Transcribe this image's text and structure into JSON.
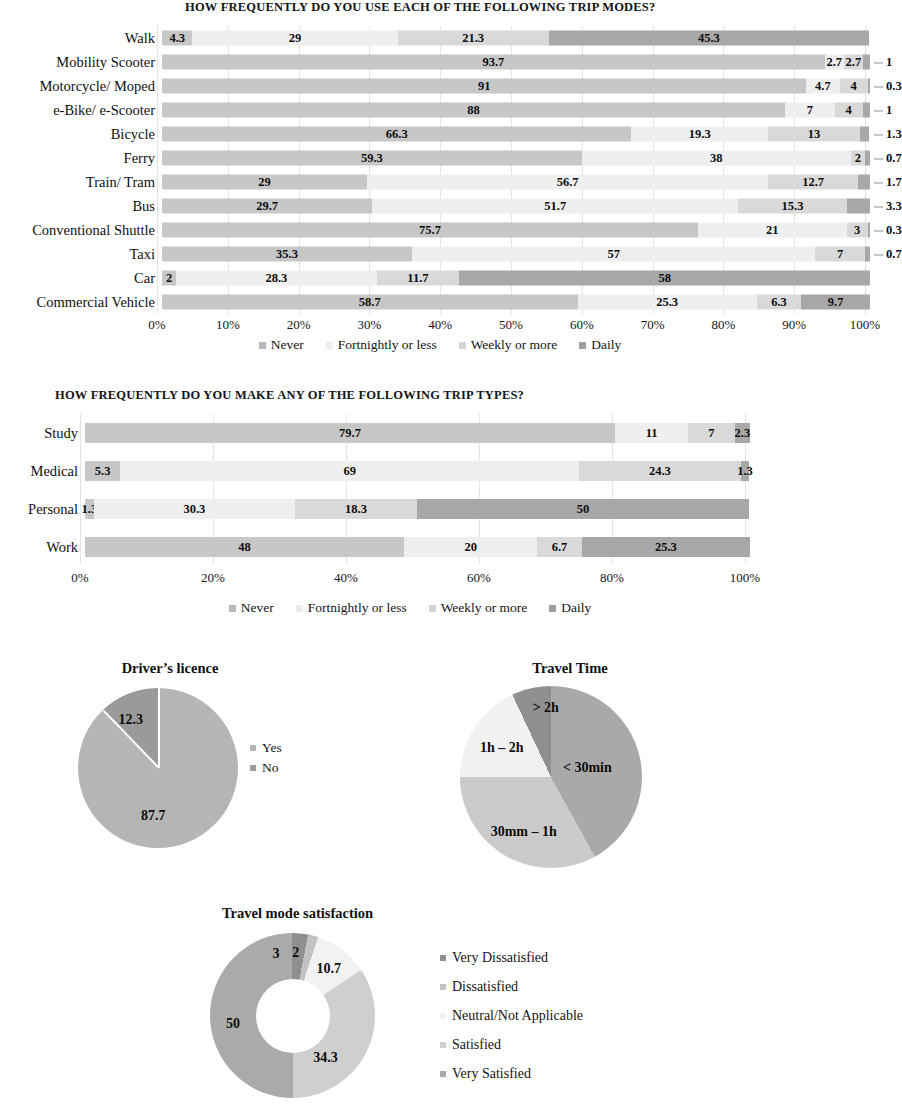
{
  "chart_data": [
    {
      "type": "bar",
      "id": "trip-modes",
      "orientation": "horizontal",
      "stacked": true,
      "percent": true,
      "title": "HOW FREQUENTLY DO YOU USE EACH OF THE FOLLOWING TRIP MODES?",
      "xlabel": "",
      "ylabel": "",
      "xlim": [
        0,
        100
      ],
      "grid": true,
      "legend_position": "bottom",
      "tick_labels": [
        "0%",
        "10%",
        "20%",
        "30%",
        "40%",
        "50%",
        "60%",
        "70%",
        "80%",
        "90%",
        "100%"
      ],
      "legend": [
        "Never",
        "Fortnightly or less",
        "Weekly or more",
        "Daily"
      ],
      "colors": [
        "#c7c7c7",
        "#efefef",
        "#d9d9d9",
        "#a8a8a8"
      ],
      "categories": [
        "Walk",
        "Mobility Scooter",
        "Motorcycle/ Moped",
        "e-Bike/ e-Scooter",
        "Bicycle",
        "Ferry",
        "Train/ Tram",
        "Bus",
        "Conventional Shuttle",
        "Taxi",
        "Car",
        "Commercial Vehicle"
      ],
      "series": [
        {
          "name": "Never",
          "values": [
            4.3,
            93.7,
            91,
            88,
            66.3,
            59.3,
            29,
            29.7,
            75.7,
            35.3,
            2,
            58.7
          ]
        },
        {
          "name": "Fortnightly or less",
          "values": [
            29,
            2.7,
            4.7,
            7,
            19.3,
            38,
            56.7,
            51.7,
            21,
            57,
            28.3,
            25.3
          ]
        },
        {
          "name": "Weekly or more",
          "values": [
            21.3,
            2.7,
            4,
            4,
            13,
            2,
            12.7,
            15.3,
            3,
            7,
            11.7,
            6.3
          ]
        },
        {
          "name": "Daily",
          "values": [
            45.3,
            1,
            0.3,
            1,
            1.3,
            0.7,
            1.7,
            3.3,
            0.3,
            0.7,
            58,
            9.7
          ]
        }
      ],
      "rows": [
        {
          "label": "Walk",
          "segments": [
            {
              "v": "4.3",
              "n": 4.3
            },
            {
              "v": "29",
              "n": 29
            },
            {
              "v": "21.3",
              "n": 21.3
            },
            {
              "v": "45.3",
              "n": 45.3
            }
          ],
          "outside": null
        },
        {
          "label": "Mobility Scooter",
          "segments": [
            {
              "v": "93.7",
              "n": 93.7
            },
            {
              "v": "2.7",
              "n": 2.7
            },
            {
              "v": "2.7",
              "n": 2.7
            },
            {
              "v": "",
              "n": 1
            }
          ],
          "outside": "1"
        },
        {
          "label": "Motorcycle/ Moped",
          "segments": [
            {
              "v": "91",
              "n": 91
            },
            {
              "v": "4.7",
              "n": 4.7
            },
            {
              "v": "4",
              "n": 4
            },
            {
              "v": "",
              "n": 0.3
            }
          ],
          "outside": "0.3"
        },
        {
          "label": "e-Bike/ e-Scooter",
          "segments": [
            {
              "v": "88",
              "n": 88
            },
            {
              "v": "7",
              "n": 7
            },
            {
              "v": "4",
              "n": 4
            },
            {
              "v": "",
              "n": 1
            }
          ],
          "outside": "1"
        },
        {
          "label": "Bicycle",
          "segments": [
            {
              "v": "66.3",
              "n": 66.3
            },
            {
              "v": "19.3",
              "n": 19.3
            },
            {
              "v": "13",
              "n": 13
            },
            {
              "v": "",
              "n": 1.3
            }
          ],
          "outside": "1.3"
        },
        {
          "label": "Ferry",
          "segments": [
            {
              "v": "59.3",
              "n": 59.3
            },
            {
              "v": "38",
              "n": 38
            },
            {
              "v": "2",
              "n": 2
            },
            {
              "v": "",
              "n": 0.7
            }
          ],
          "outside": "0.7"
        },
        {
          "label": "Train/ Tram",
          "segments": [
            {
              "v": "29",
              "n": 29
            },
            {
              "v": "56.7",
              "n": 56.7
            },
            {
              "v": "12.7",
              "n": 12.7
            },
            {
              "v": "",
              "n": 1.7
            }
          ],
          "outside": "1.7"
        },
        {
          "label": "Bus",
          "segments": [
            {
              "v": "29.7",
              "n": 29.7
            },
            {
              "v": "51.7",
              "n": 51.7
            },
            {
              "v": "15.3",
              "n": 15.3
            },
            {
              "v": "",
              "n": 3.3
            }
          ],
          "outside": "3.3"
        },
        {
          "label": "Conventional Shuttle",
          "segments": [
            {
              "v": "75.7",
              "n": 75.7
            },
            {
              "v": "21",
              "n": 21
            },
            {
              "v": "3",
              "n": 3
            },
            {
              "v": "",
              "n": 0.3
            }
          ],
          "outside": "0.3"
        },
        {
          "label": "Taxi",
          "segments": [
            {
              "v": "35.3",
              "n": 35.3
            },
            {
              "v": "57",
              "n": 57
            },
            {
              "v": "7",
              "n": 7
            },
            {
              "v": "",
              "n": 0.7
            }
          ],
          "outside": "0.7"
        },
        {
          "label": "Car",
          "segments": [
            {
              "v": "2",
              "n": 2
            },
            {
              "v": "28.3",
              "n": 28.3
            },
            {
              "v": "11.7",
              "n": 11.7
            },
            {
              "v": "58",
              "n": 58
            }
          ],
          "outside": null
        },
        {
          "label": "Commercial Vehicle",
          "segments": [
            {
              "v": "58.7",
              "n": 58.7
            },
            {
              "v": "25.3",
              "n": 25.3
            },
            {
              "v": "6.3",
              "n": 6.3
            },
            {
              "v": "9.7",
              "n": 9.7
            }
          ],
          "outside": null
        }
      ]
    },
    {
      "type": "bar",
      "id": "trip-types",
      "orientation": "horizontal",
      "stacked": true,
      "percent": true,
      "title": "HOW FREQUENTLY DO YOU MAKE ANY OF THE FOLLOWING TRIP TYPES?",
      "xlabel": "",
      "ylabel": "",
      "xlim": [
        0,
        100
      ],
      "grid": true,
      "legend_position": "bottom",
      "tick_labels": [
        "0%",
        "20%",
        "40%",
        "60%",
        "80%",
        "100%"
      ],
      "legend": [
        "Never",
        "Fortnightly or less",
        "Weekly or more",
        "Daily"
      ],
      "colors": [
        "#c7c7c7",
        "#efefef",
        "#d9d9d9",
        "#a8a8a8"
      ],
      "categories": [
        "Study",
        "Medical",
        "Personal",
        "Work"
      ],
      "series": [
        {
          "name": "Never",
          "values": [
            79.7,
            5.3,
            1.3,
            48
          ]
        },
        {
          "name": "Fortnightly or less",
          "values": [
            11,
            69,
            30.3,
            20
          ]
        },
        {
          "name": "Weekly or more",
          "values": [
            7,
            24.3,
            18.3,
            6.7
          ]
        },
        {
          "name": "Daily",
          "values": [
            2.3,
            1.3,
            50,
            25.3
          ]
        }
      ],
      "rows": [
        {
          "label": "Study",
          "segments": [
            {
              "v": "79.7",
              "n": 79.7
            },
            {
              "v": "11",
              "n": 11
            },
            {
              "v": "7",
              "n": 7
            },
            {
              "v": "2.3",
              "n": 2.3
            }
          ],
          "outside": null
        },
        {
          "label": "Medical",
          "segments": [
            {
              "v": "5.3",
              "n": 5.3
            },
            {
              "v": "69",
              "n": 69
            },
            {
              "v": "24.3",
              "n": 24.3
            },
            {
              "v": "1.3",
              "n": 1.3
            }
          ],
          "outside": null
        },
        {
          "label": "Personal",
          "segments": [
            {
              "v": "1.3",
              "n": 1.3
            },
            {
              "v": "30.3",
              "n": 30.3
            },
            {
              "v": "18.3",
              "n": 18.3
            },
            {
              "v": "50",
              "n": 50
            }
          ],
          "outside": null
        },
        {
          "label": "Work",
          "segments": [
            {
              "v": "48",
              "n": 48
            },
            {
              "v": "20",
              "n": 20
            },
            {
              "v": "6.7",
              "n": 6.7
            },
            {
              "v": "25.3",
              "n": 25.3
            }
          ],
          "outside": null
        }
      ]
    },
    {
      "type": "pie",
      "id": "drivers-licence",
      "title": "Driver’s licence",
      "legend_position": "right",
      "labels": [
        "Yes",
        "No"
      ],
      "values": [
        87.7,
        12.3
      ],
      "colors": [
        "#b5b5b5",
        "#9a9a9a"
      ],
      "slice_labels": [
        "87.7",
        "12.3"
      ]
    },
    {
      "type": "pie",
      "id": "travel-time",
      "title": "Travel Time",
      "legend_position": "none",
      "labels": [
        "< 30min",
        "30mm – 1h",
        "1h – 2h",
        "> 2h"
      ],
      "values": [
        42,
        33,
        18,
        7
      ],
      "colors": [
        "#a9a9a9",
        "#cbcbcb",
        "#f1f1f1",
        "#8f8f8f"
      ],
      "slice_labels": [
        "< 30min",
        "30mm – 1h",
        "1h – 2h",
        "> 2h"
      ]
    },
    {
      "type": "pie",
      "id": "travel-mode-satisfaction",
      "subtype": "donut",
      "title": "Travel mode satisfaction",
      "legend_position": "right",
      "labels": [
        "Very Dissatisfied",
        "Dissatisfied",
        "Neutral/Not Applicable",
        "Satisfied",
        "Very Satisfied"
      ],
      "values": [
        3,
        2,
        10.7,
        34.3,
        50
      ],
      "colors": [
        "#8f8f8f",
        "#c2c2c2",
        "#f2f2f2",
        "#cfcfcf",
        "#aaaaaa"
      ],
      "slice_labels": [
        "3",
        "2",
        "10.7",
        "34.3",
        "50"
      ]
    }
  ],
  "charts": {
    "trip_modes": {
      "title": "HOW FREQUENTLY DO YOU USE EACH OF THE FOLLOWING TRIP MODES?",
      "legend": [
        {
          "label": "Never"
        },
        {
          "label": "Fortnightly or less"
        },
        {
          "label": "Weekly or more"
        },
        {
          "label": "Daily"
        }
      ]
    },
    "trip_types": {
      "title": "HOW FREQUENTLY DO YOU MAKE ANY OF THE FOLLOWING TRIP TYPES?",
      "legend": [
        {
          "label": "Never"
        },
        {
          "label": "Fortnightly or less"
        },
        {
          "label": "Weekly or more"
        },
        {
          "label": "Daily"
        }
      ]
    },
    "drivers_licence": {
      "title": "Driver’s licence",
      "legend": [
        {
          "label": "Yes"
        },
        {
          "label": "No"
        }
      ]
    },
    "travel_time": {
      "title": "Travel Time"
    },
    "satisfaction": {
      "title": "Travel mode satisfaction",
      "legend": [
        {
          "label": "Very Dissatisfied"
        },
        {
          "label": "Dissatisfied"
        },
        {
          "label": "Neutral/Not Applicable"
        },
        {
          "label": "Satisfied"
        },
        {
          "label": "Very Satisfied"
        }
      ]
    }
  }
}
